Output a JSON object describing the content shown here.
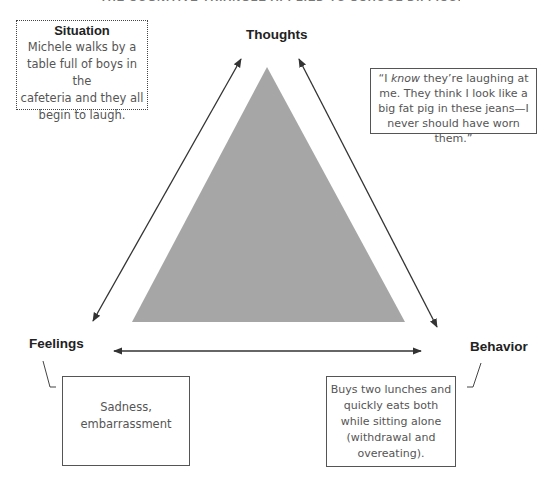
{
  "header": {
    "cropped_title": "THE COGNITIVE TRIANGLE APPLIED TO SCHOOL DIFFICULTIES"
  },
  "colors": {
    "triangle_fill": "#a6a6a6",
    "line": "#333333",
    "box_border": "#555555",
    "body_text": "#555555",
    "label_text": "#222222"
  },
  "diagram": {
    "vertices": {
      "thoughts": {
        "label": "Thoughts"
      },
      "feelings": {
        "label": "Feelings"
      },
      "behavior": {
        "label": "Behavior"
      }
    },
    "arrows": [
      {
        "from": "feelings",
        "to": "thoughts",
        "bidirectional": true
      },
      {
        "from": "thoughts",
        "to": "behavior",
        "bidirectional": true
      },
      {
        "from": "feelings",
        "to": "behavior",
        "bidirectional": true
      }
    ]
  },
  "situation": {
    "title": "Situation",
    "lines": [
      "Michele walks by a",
      "table full of boys in the",
      "cafeteria and they all",
      "begin to laugh."
    ]
  },
  "thoughts_box": {
    "open_quote": "“I ",
    "emphasis": "know",
    "line1_rest": " they’re laughing at",
    "lines": [
      "me. They think I look like a",
      "big fat pig in these jeans—I",
      "never should have worn",
      "them.”"
    ]
  },
  "feelings_box": {
    "lines": [
      "Sadness,",
      "embarrassment"
    ]
  },
  "behavior_box": {
    "lines": [
      "Buys two lunches and",
      "quickly eats both",
      "while sitting alone",
      "(withdrawal and",
      "overeating)."
    ]
  }
}
